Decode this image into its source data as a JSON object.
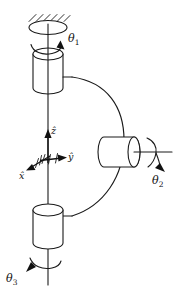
{
  "figure": {
    "background_color": "#ffffff",
    "line_color": "#1a1a1a"
  },
  "joints": [
    {
      "id": "theta1",
      "label": "θ",
      "subscript": "1",
      "axis": "vertical",
      "location": "top",
      "description": "Revolute joint at fixed ground support"
    },
    {
      "id": "theta2",
      "label": "θ",
      "subscript": "2",
      "axis": "horizontal",
      "location": "right",
      "description": "Revolute joint at horizontal cylinder shaft"
    },
    {
      "id": "theta3",
      "label": "θ",
      "subscript": "3",
      "axis": "vertical",
      "location": "bottom",
      "description": "Revolute joint at lower cylinder"
    }
  ],
  "frame": {
    "name": "body-fixed-coordinate-frame",
    "axes": [
      {
        "id": "x",
        "label": "x̂",
        "direction": "lower-left"
      },
      {
        "id": "y",
        "label": "ŷ",
        "direction": "right"
      },
      {
        "id": "z",
        "label": "ẑ",
        "direction": "up"
      }
    ]
  },
  "parts": {
    "ground_support": "hatched-fixed-ground",
    "upper_cylinder": "upper-link-cylinder",
    "lower_cylinder": "lower-link-cylinder",
    "horizontal_cylinder": "horizontal-link-cylinder",
    "curved_link": "c-shaped-connecting-link",
    "center_shaft": "vertical-center-shaft"
  }
}
